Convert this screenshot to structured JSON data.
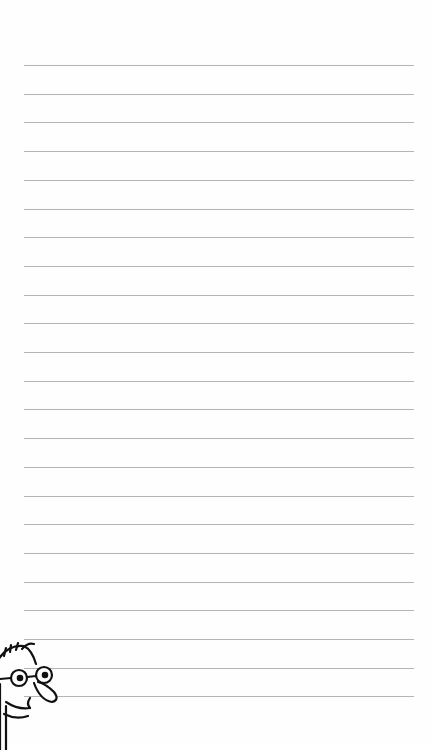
{
  "page": {
    "type": "lined-notebook-page",
    "background_color": "#fefefe",
    "line_color": "#b4b4b4",
    "line_count": 23,
    "first_line_y": 65,
    "line_spacing": 28.7,
    "line_left": 24,
    "line_right": 414
  },
  "illustration": {
    "icon": "cartoon-face-with-glasses-icon",
    "position": "bottom-left"
  }
}
